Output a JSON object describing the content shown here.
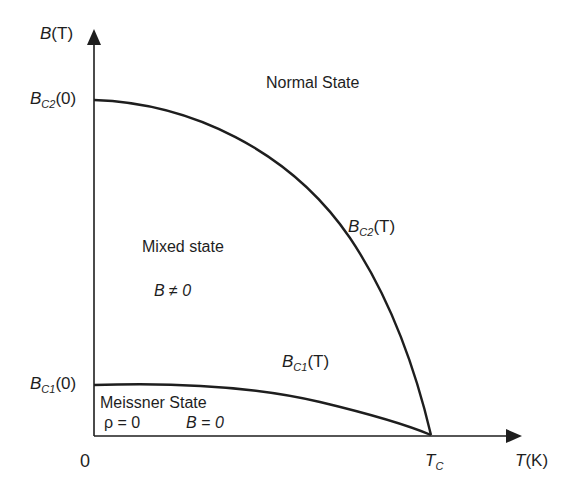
{
  "diagram": {
    "colors": {
      "line": "#1e1e1e",
      "background": "#ffffff"
    },
    "axes": {
      "y_label": {
        "main": "B",
        "paren": "(T)"
      },
      "x_label": {
        "main": "T",
        "paren": "(K)"
      },
      "origin_label": "0",
      "tc_label": {
        "main": "T",
        "sub": "C"
      }
    },
    "ticks": {
      "bc2_zero": {
        "main": "B",
        "sub": "C2",
        "paren": "(0)"
      },
      "bc1_zero": {
        "main": "B",
        "sub": "C1",
        "paren": "(0)"
      }
    },
    "curves": {
      "bc2": {
        "main": "B",
        "sub": "C2",
        "paren": "(T)"
      },
      "bc1": {
        "main": "B",
        "sub": "C1",
        "paren": "(T)"
      }
    },
    "regions": {
      "normal": "Normal State",
      "mixed": "Mixed state",
      "mixed_condition": "B ≠ 0",
      "meissner": "Meissner State",
      "meissner_rho": "ρ = 0",
      "meissner_b": "B = 0"
    }
  }
}
